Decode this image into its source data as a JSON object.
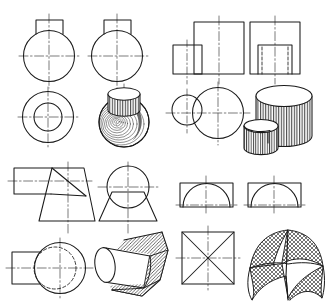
{
  "document": {
    "title": "Intersections of Solids — Orthographic Projections and Pictorials",
    "sheet_width": 327,
    "sheet_height": 306,
    "background_color": "#ffffff",
    "line_color": "#1a1a1a",
    "shading_color": "#4a4a4a",
    "hidden_line_style": "dashed",
    "center_line_style": "dash-dot"
  },
  "figures": [
    {
      "id": "figure-1",
      "name": "sphere-with-cylindrical-boss",
      "quadrant": "top-left",
      "description": "Sphere penetrated by a small vertical cylinder (boss) on top",
      "views": [
        {
          "name": "front-view",
          "type": "orthographic",
          "shapes": [
            "circle",
            "rectangle",
            "center-lines"
          ],
          "circle": {
            "cx": 49,
            "cy": 56,
            "r": 26
          },
          "boss_rect": {
            "x": 35,
            "y": 17,
            "w": 28,
            "h": 17
          }
        },
        {
          "name": "side-view",
          "type": "orthographic",
          "shapes": [
            "circle",
            "rectangle",
            "center-lines"
          ],
          "circle": {
            "cx": 118,
            "cy": 56,
            "r": 26
          },
          "boss_rect": {
            "x": 104,
            "y": 17,
            "w": 28,
            "h": 17
          }
        },
        {
          "name": "top-view",
          "type": "orthographic",
          "shapes": [
            "concentric-circles",
            "center-lines"
          ],
          "outer_circle": {
            "cx": 48,
            "cy": 117,
            "r": 26
          },
          "inner_circle": {
            "cx": 48,
            "cy": 117,
            "r": 14
          }
        },
        {
          "name": "pictorial-view",
          "type": "isometric",
          "shading": "concentric-contour-lines",
          "shapes": [
            "sphere",
            "cylinder-boss"
          ]
        }
      ]
    },
    {
      "id": "figure-2",
      "name": "two-intersecting-cylinders",
      "quadrant": "top-right",
      "description": "Large vertical cylinder intersected by a smaller vertical cylinder",
      "views": [
        {
          "name": "front-view",
          "type": "orthographic",
          "shapes": [
            "large-rectangle",
            "small-rectangle",
            "center-line"
          ],
          "large_rect": {
            "x": 194,
            "y": 22,
            "w": 50,
            "h": 52
          },
          "small_rect": {
            "x": 173,
            "y": 45,
            "w": 29,
            "h": 29
          }
        },
        {
          "name": "side-view",
          "type": "orthographic",
          "shapes": [
            "outer-rectangle",
            "inner-rectangle",
            "hidden-lines",
            "center-line"
          ],
          "outer_rect": {
            "x": 250,
            "y": 22,
            "w": 50,
            "h": 52
          },
          "inner_rect": {
            "x": 258,
            "y": 45,
            "w": 34,
            "h": 29
          }
        },
        {
          "name": "top-view",
          "type": "orthographic",
          "shapes": [
            "large-circle",
            "small-circle",
            "center-lines"
          ],
          "large_circle": {
            "cx": 218,
            "cy": 113,
            "r": 26
          },
          "small_circle": {
            "cx": 186,
            "cy": 110,
            "r": 15
          }
        },
        {
          "name": "pictorial-view",
          "type": "isometric",
          "shading": "vertical-ruled-lines",
          "shapes": [
            "large-cylinder",
            "small-cylinder"
          ]
        }
      ]
    },
    {
      "id": "figure-3",
      "name": "cone-intersected-by-cylinder",
      "quadrant": "bottom-left",
      "description": "Truncated cone (frustum) penetrated horizontally by a cylinder",
      "views": [
        {
          "name": "front-view",
          "type": "orthographic",
          "shapes": [
            "trapezoid",
            "rectangle",
            "intersection-line",
            "center-lines"
          ],
          "frustum_points": "52,168 84,168 96,221 40,221",
          "cyl_rect": {
            "x": 14,
            "y": 168,
            "w": 40,
            "h": 26
          }
        },
        {
          "name": "side-view",
          "type": "orthographic",
          "shapes": [
            "trapezoid",
            "circle",
            "center-lines"
          ],
          "trapezoid_points": "108,196 148,196 158,221 98,221",
          "circle": {
            "cx": 128,
            "cy": 189,
            "r": 21
          }
        },
        {
          "name": "top-view",
          "type": "orthographic",
          "shapes": [
            "circle",
            "hidden-circle",
            "rectangle",
            "center-lines"
          ],
          "outer_circle": {
            "cx": 60,
            "cy": 268,
            "r": 26
          },
          "hidden_circle": {
            "cx": 56,
            "cy": 268,
            "r": 21
          },
          "cyl_rect": {
            "x": 12,
            "y": 252,
            "w": 38,
            "h": 32
          }
        },
        {
          "name": "pictorial-view",
          "type": "isometric",
          "shading": "cross-hatch",
          "shapes": [
            "cone",
            "cylinder"
          ]
        }
      ]
    },
    {
      "id": "figure-4",
      "name": "groin-vault-intersecting-cylinders",
      "quadrant": "bottom-right",
      "description": "Two semicylindrical vaults intersecting at right angles forming a groin vault",
      "views": [
        {
          "name": "front-view",
          "type": "orthographic",
          "shapes": [
            "rectangle",
            "semicircular-arch",
            "center-line"
          ],
          "rect": {
            "x": 180,
            "y": 183,
            "w": 53,
            "h": 24
          },
          "arch_radius": 24
        },
        {
          "name": "side-view",
          "type": "orthographic",
          "shapes": [
            "rectangle",
            "semicircular-arch",
            "center-line"
          ],
          "rect": {
            "x": 248,
            "y": 183,
            "w": 53,
            "h": 24
          },
          "arch_radius": 24
        },
        {
          "name": "top-view",
          "type": "orthographic",
          "shapes": [
            "square",
            "diagonals",
            "center-lines"
          ],
          "square": {
            "x": 182,
            "y": 232,
            "w": 52,
            "h": 52
          }
        },
        {
          "name": "pictorial-view",
          "type": "isometric",
          "shading": "cross-hatch",
          "shapes": [
            "groin-vault"
          ]
        }
      ]
    }
  ],
  "legend": {
    "visible_edge": "continuous thick line",
    "hidden_edge": "dashed line",
    "axis": "chain dash-dot line"
  }
}
